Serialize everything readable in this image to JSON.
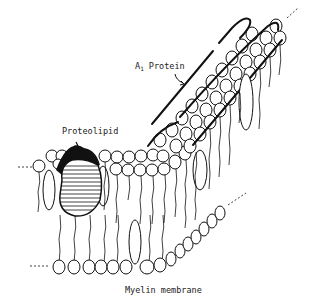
{
  "diagram": {
    "title": "Myelin membrane",
    "labels": {
      "a1_protein_main": "A",
      "a1_protein_sub": "1",
      "a1_protein_rest": " Protein",
      "proteolipid": "Proteolipid"
    },
    "elements": [
      "lipid bilayer",
      "proteolipid (hatched)",
      "A1 protein (surface strand)",
      "cholesterol ovals"
    ]
  }
}
